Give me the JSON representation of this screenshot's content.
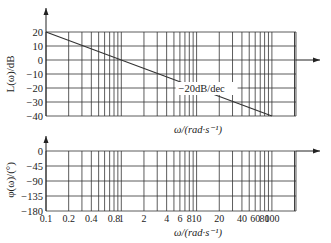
{
  "chart_data": [
    {
      "type": "line",
      "title": "",
      "xlabel": "ω/(rad·s⁻¹)",
      "ylabel": "L(ω)/dB",
      "xscale": "log",
      "xlim": [
        0.1,
        200
      ],
      "ylim": [
        -40,
        20
      ],
      "yticks": [
        20,
        10,
        0,
        -10,
        -20,
        -30,
        -40
      ],
      "ytick_labels": [
        "20",
        "10",
        "0",
        "−10",
        "−20",
        "−30",
        "−40"
      ],
      "grid": true,
      "series": [
        {
          "name": "asymptote",
          "x": [
            0.1,
            100
          ],
          "y": [
            20,
            -40
          ]
        }
      ],
      "annotations": [
        {
          "text": "−20dB/dec",
          "x": 10,
          "y": -20
        }
      ]
    },
    {
      "type": "line",
      "title": "",
      "xlabel": "ω/(rad·s⁻¹)",
      "ylabel": "φ(ω)/(°)",
      "xscale": "log",
      "xlim": [
        0.1,
        200
      ],
      "ylim": [
        -180,
        0
      ],
      "yticks": [
        0,
        -45,
        -90,
        -135,
        -180
      ],
      "ytick_labels": [
        "0",
        "−45",
        "−90",
        "−135",
        "−180"
      ],
      "xticks": [
        0.1,
        0.2,
        0.4,
        0.8,
        1,
        2,
        4,
        6,
        8,
        10,
        20,
        40,
        60,
        80,
        100
      ],
      "xtick_labels": [
        "0.1",
        "0.2",
        "0.4",
        "0.8",
        "1",
        "2",
        "4",
        "6",
        "8",
        "10",
        "20",
        "40",
        "60",
        "80",
        "100"
      ],
      "grid": true,
      "series": []
    }
  ],
  "labels": {
    "mag_ylabel": "L(ω)/dB",
    "phase_ylabel": "φ(ω)/(°)",
    "mag_xlabel": "ω/(rad·s⁻¹)",
    "phase_xlabel": "ω/(rad·s⁻¹)",
    "slope_label": "−20dB/dec"
  }
}
